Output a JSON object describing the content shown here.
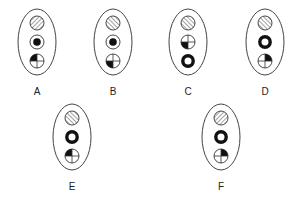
{
  "figures": [
    {
      "label": "A",
      "symbols": [
        {
          "type": "hatch",
          "direction": "forward"
        },
        {
          "type": "target"
        },
        {
          "type": "quadrant",
          "filled": "top-left"
        }
      ]
    },
    {
      "label": "B",
      "symbols": [
        {
          "type": "hatch",
          "direction": "back"
        },
        {
          "type": "target"
        },
        {
          "type": "quadrant",
          "filled": "bottom-left"
        }
      ]
    },
    {
      "label": "C",
      "symbols": [
        {
          "type": "hatch",
          "direction": "back"
        },
        {
          "type": "quadrant",
          "filled": "bottom-left"
        },
        {
          "type": "ring"
        }
      ]
    },
    {
      "label": "D",
      "symbols": [
        {
          "type": "hatch",
          "direction": "back"
        },
        {
          "type": "ring"
        },
        {
          "type": "quadrant",
          "filled": "top-right"
        }
      ]
    },
    {
      "label": "E",
      "symbols": [
        {
          "type": "hatch",
          "direction": "back"
        },
        {
          "type": "ring"
        },
        {
          "type": "quadrant",
          "filled": "top-left"
        }
      ]
    },
    {
      "label": "F",
      "symbols": [
        {
          "type": "hatch",
          "direction": "forward"
        },
        {
          "type": "ring"
        },
        {
          "type": "quadrant",
          "filled": "top-right"
        }
      ]
    }
  ]
}
